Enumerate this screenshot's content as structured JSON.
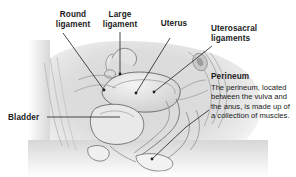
{
  "figure": {
    "type": "medical-illustration",
    "background_color": "#ffffff",
    "label_color": "#1a1a1a",
    "leader_color": "#2b2b2b"
  },
  "labels": {
    "round_ligament": "Round\nligament",
    "large_ligament": "Large\nligament",
    "uterus": "Uterus",
    "uterosacral_ligaments": "Uterosacral\nligaments",
    "bladder": "Bladder",
    "perineum_heading": "Perineum"
  },
  "callout": {
    "perineum_body": "The perineum, located between the vulva and the anus, is made up of a collection of muscles."
  }
}
